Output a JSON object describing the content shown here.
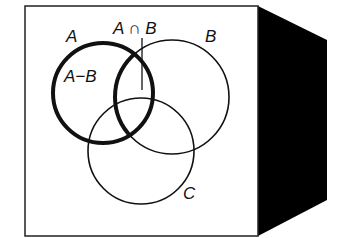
{
  "diagram": {
    "type": "venn",
    "colors": {
      "background": "#ffffff",
      "stroke": "#111111",
      "side_panel": "#000000"
    },
    "labels": {
      "set_a": "A",
      "set_b": "B",
      "set_c": "C",
      "difference": "A−B",
      "intersection": "A ∩ B"
    },
    "sets": [
      {
        "name": "A",
        "cx": 103,
        "cy": 93,
        "r": 50,
        "emphasized": true
      },
      {
        "name": "B",
        "cx": 172,
        "cy": 97,
        "r": 57,
        "emphasized": false
      },
      {
        "name": "C",
        "cx": 141,
        "cy": 151,
        "r": 53,
        "emphasized": false
      }
    ]
  }
}
